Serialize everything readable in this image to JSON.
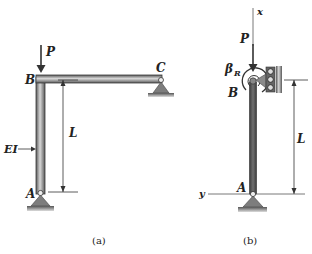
{
  "figure": {
    "panel_a": {
      "caption": "(a)",
      "labels": {
        "load": "P",
        "joint_top_left": "B",
        "joint_top_right": "C",
        "joint_bottom": "A",
        "length": "L",
        "stiffness": "EI"
      },
      "elements": [
        "column AB",
        "beam BC",
        "pin support A",
        "pin support C",
        "load P at B"
      ]
    },
    "panel_b": {
      "caption": "(b)",
      "labels": {
        "load": "P",
        "spring": "β",
        "spring_subscript": "R",
        "joint_top": "B",
        "joint_bottom": "A",
        "length": "L",
        "axis_x": "x",
        "axis_y": "y"
      },
      "elements": [
        "column AB",
        "rotational spring at B",
        "roller guide at B",
        "pin support A",
        "load P at B"
      ]
    },
    "colors": {
      "member_dark": "#4a4a4a",
      "member_light": "#bdbdbd",
      "support_fill": "#7d7d7d",
      "line": "#222222"
    }
  }
}
